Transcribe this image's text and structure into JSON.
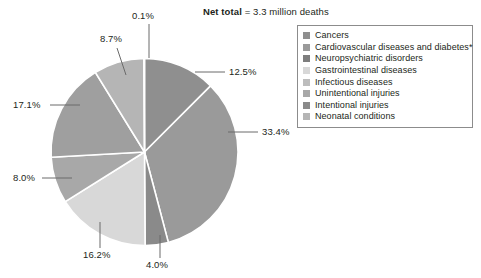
{
  "caption": {
    "label": "Net total",
    "value": "= 3.3 million deaths"
  },
  "legend": {
    "items": [
      {
        "label": "Cancers",
        "color": "#8f8f8f"
      },
      {
        "label": "Cardiovascular diseases and diabetes*",
        "color": "#9a9a9a"
      },
      {
        "label": "Neuropsychiatric disorders",
        "color": "#7e7e7e"
      },
      {
        "label": "Gastrointestinal diseases",
        "color": "#d8d8d8"
      },
      {
        "label": "Infectious diseases",
        "color": "#bdbdbd"
      },
      {
        "label": "Unintentional injuries",
        "color": "#a8a8a8"
      },
      {
        "label": "Intentional injuries",
        "color": "#8a8a8a"
      },
      {
        "label": "Neonatal conditions",
        "color": "#b5b5b5"
      }
    ]
  },
  "chart_data": {
    "type": "pie",
    "title": "Net total = 3.3 million deaths",
    "total_label": "3.3 million deaths",
    "legend_position": "right",
    "categories": [
      "Cancers",
      "Cardiovascular diseases and diabetes*",
      "Intentional injuries",
      "Gastrointestinal diseases",
      "Unintentional injuries",
      "Neuropsychiatric disorders",
      "Infectious diseases",
      "Neonatal conditions"
    ],
    "values": [
      12.5,
      33.4,
      4.0,
      16.2,
      8.0,
      17.1,
      8.7,
      0.1
    ],
    "value_labels": [
      "12.5%",
      "33.4%",
      "4.0%",
      "16.2%",
      "8.0%",
      "17.1%",
      "8.7%",
      "0.1%"
    ],
    "colors": [
      "#8f8f8f",
      "#9a9a9a",
      "#8a8a8a",
      "#d8d8d8",
      "#a8a8a8",
      "#9f9f9f",
      "#b5b5b5",
      "#cfcfcf"
    ],
    "units": "percent",
    "slices": [
      {
        "label": "Cancers",
        "value": 12.5,
        "value_label": "12.5%",
        "color": "#8f8f8f"
      },
      {
        "label": "Cardiovascular diseases and diabetes*",
        "value": 33.4,
        "value_label": "33.4%",
        "color": "#9a9a9a"
      },
      {
        "label": "Intentional injuries",
        "value": 4.0,
        "value_label": "4.0%",
        "color": "#8a8a8a"
      },
      {
        "label": "Gastrointestinal diseases",
        "value": 16.2,
        "value_label": "16.2%",
        "color": "#d8d8d8"
      },
      {
        "label": "Unintentional injuries",
        "value": 8.0,
        "value_label": "8.0%",
        "color": "#a8a8a8"
      },
      {
        "label": "Neuropsychiatric disorders",
        "value": 17.1,
        "value_label": "17.1%",
        "color": "#9f9f9f"
      },
      {
        "label": "Infectious diseases",
        "value": 8.7,
        "value_label": "8.7%",
        "color": "#b5b5b5"
      },
      {
        "label": "Neonatal conditions",
        "value": 0.1,
        "value_label": "0.1%",
        "color": "#cfcfcf"
      }
    ]
  },
  "labels": {
    "pct_0_1": "0.1%",
    "pct_8_7": "8.7%",
    "pct_12_5": "12.5%",
    "pct_33_4": "33.4%",
    "pct_4_0": "4.0%",
    "pct_16_2": "16.2%",
    "pct_8_0": "8.0%",
    "pct_17_1": "17.1%"
  }
}
